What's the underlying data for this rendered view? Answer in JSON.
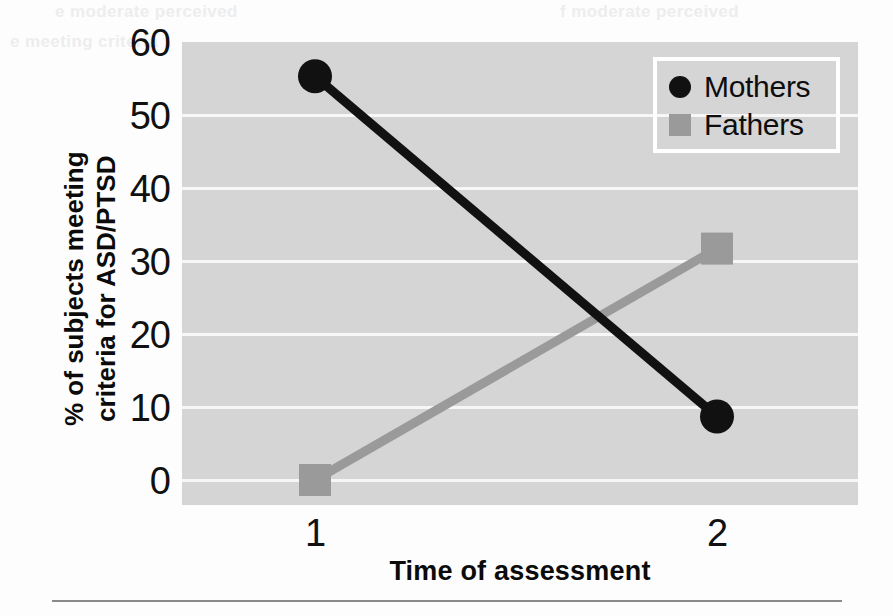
{
  "figure": {
    "background_color": "#fdfdfd",
    "plot_background_color": "#d5d5d5",
    "gridline_color": "#f7f7f7"
  },
  "ghost_text": {
    "line1": "e moderate perceived",
    "line2": "f moderate perceived",
    "line3": "e meeting criteria"
  },
  "axes": {
    "x_title": "Time of assessment",
    "y_title_line1": "% of subjects meeting",
    "y_title_line2": "criteria for ASD/PTSD",
    "x_tick_labels": [
      "1",
      "2"
    ],
    "y_tick_labels": [
      "0",
      "10",
      "20",
      "30",
      "40",
      "50",
      "60"
    ]
  },
  "legend": {
    "position": "top-right",
    "border_color": "#ffffff",
    "entries": [
      {
        "label": "Mothers",
        "marker": "circle",
        "color": "#111111"
      },
      {
        "label": "Fathers",
        "marker": "square",
        "color": "#9a9a9a"
      }
    ]
  },
  "chart_data": {
    "type": "line",
    "title": "",
    "xlabel": "Time of assessment",
    "ylabel": "% of subjects meeting criteria for ASD/PTSD",
    "categories": [
      "1",
      "2"
    ],
    "x": [
      1,
      2
    ],
    "xlim": [
      0.6,
      2.4
    ],
    "ylim": [
      0,
      60
    ],
    "yticks": [
      0,
      10,
      20,
      30,
      40,
      50,
      60
    ],
    "grid": true,
    "legend_position": "top-right",
    "series": [
      {
        "name": "Mothers",
        "values": [
          55.3,
          8.7
        ],
        "color": "#111111",
        "marker": "circle"
      },
      {
        "name": "Fathers",
        "values": [
          0.0,
          31.7
        ],
        "color": "#9a9a9a",
        "marker": "square"
      }
    ]
  }
}
